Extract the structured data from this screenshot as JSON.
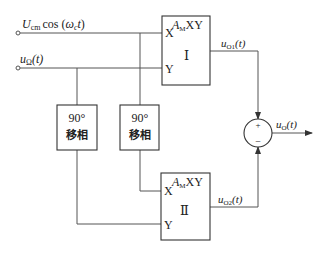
{
  "inputs": {
    "carrier": {
      "main": "U",
      "sub": "cm",
      "rest": "cos (",
      "omega": "ω",
      "omega_sub": "c",
      "t": "t",
      "close": ")"
    },
    "modulating": {
      "main": "u",
      "sub": "Ω",
      "rest": "(t)"
    }
  },
  "multiplier_1": {
    "gain": "A",
    "gain_sub": "M",
    "gain_rest": "XY",
    "x_label": "X",
    "y_label": "Y",
    "id_label": "Ⅰ"
  },
  "multiplier_2": {
    "gain": "A",
    "gain_sub": "M",
    "gain_rest": "XY",
    "x_label": "X",
    "y_label": "Y",
    "id_label": "Ⅱ"
  },
  "phase_shifter_1": {
    "angle": "90°",
    "name": "移相"
  },
  "phase_shifter_2": {
    "angle": "90°",
    "name": "移相"
  },
  "outputs": {
    "o1": {
      "main": "u",
      "sub": "O1",
      "rest": "(t)"
    },
    "o2": {
      "main": "u",
      "sub": "O2",
      "rest": "(t)"
    },
    "o": {
      "main": "u",
      "sub": "O",
      "rest": "(t)"
    }
  },
  "summer": {
    "plus": "+",
    "minus": "−"
  }
}
